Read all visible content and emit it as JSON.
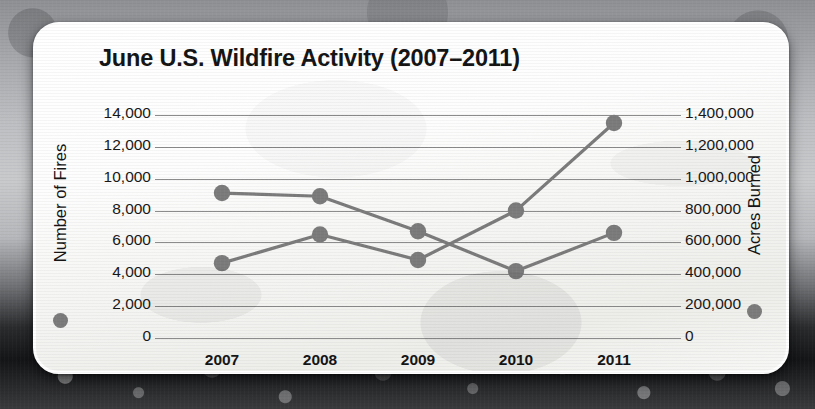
{
  "chart_data": {
    "type": "line",
    "title": "June U.S. Wildfire Activity (2007–2011)",
    "categories": [
      "2007",
      "2008",
      "2009",
      "2010",
      "2011"
    ],
    "x": [
      2007,
      2008,
      2009,
      2010,
      2011
    ],
    "xlabel": "",
    "grid": true,
    "legend_position": "axis-titles",
    "marker": "circle",
    "series": [
      {
        "name": "Number of Fires",
        "axis": "left",
        "color": "#7b7b7b",
        "values": [
          9100,
          8900,
          6700,
          4200,
          6600
        ]
      },
      {
        "name": "Acres Burned",
        "axis": "right",
        "color": "#7b7b7b",
        "values": [
          470000,
          650000,
          490000,
          800000,
          1350000
        ]
      }
    ],
    "left_axis": {
      "label": "Number of Fires",
      "ylim": [
        0,
        14000
      ],
      "tick_step": 2000,
      "ticks": [
        "0",
        "2,000",
        "4,000",
        "6,000",
        "8,000",
        "10,000",
        "12,000",
        "14,000"
      ],
      "tick_values": [
        0,
        2000,
        4000,
        6000,
        8000,
        10000,
        12000,
        14000
      ]
    },
    "right_axis": {
      "label": "Acres Burned",
      "ylim": [
        0,
        1400000
      ],
      "tick_step": 200000,
      "ticks": [
        "0",
        "200,000",
        "400,000",
        "600,000",
        "800,000",
        "1,000,000",
        "1,200,000",
        "1,400,000"
      ],
      "tick_values": [
        0,
        200000,
        400000,
        600000,
        800000,
        1000000,
        1200000,
        1400000
      ]
    }
  },
  "legend": {
    "left_marker": "circle-marker",
    "right_marker": "circle-marker"
  }
}
